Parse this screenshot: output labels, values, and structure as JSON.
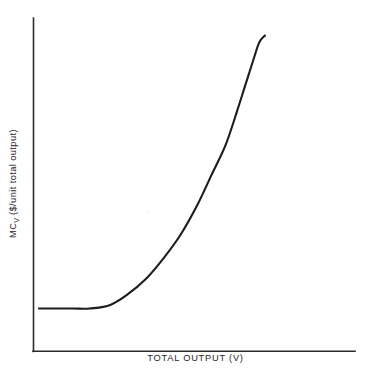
{
  "chart_data": {
    "type": "line",
    "title": "",
    "subtitle": "",
    "xlabel": "TOTAL OUTPUT (V)",
    "ylabel_prefix": "MC",
    "ylabel_subscript": "V",
    "ylabel_suffix": " ($/unit total output)",
    "ylabel_full": "MCV ($/unit total output)",
    "grid": false,
    "legend": null,
    "axis_ticks": [],
    "tick_labels": [],
    "annotations": [],
    "line_color": "#1c1c1c",
    "axis_color": "#2b2b2b",
    "background_color": "#ffffff",
    "xlim": [
      0,
      100
    ],
    "ylim": [
      0,
      100
    ],
    "series": [
      {
        "name": "Marginal cost of total output",
        "description": "Flat at a constant minimum over low output, then rising at an increasing rate (exponential) as output grows.",
        "x": [
          2,
          8,
          14,
          20,
          27,
          33,
          40,
          46,
          52,
          58,
          63,
          68,
          72,
          75,
          78,
          80,
          82
        ],
        "y": [
          13,
          13,
          13,
          13,
          14,
          17,
          22,
          28,
          35,
          44,
          53,
          62,
          72,
          80,
          88,
          93,
          95
        ]
      }
    ]
  },
  "figure": {
    "x_axis_label": "TOTAL OUTPUT (V)",
    "y_axis_label_prefix": "MC",
    "y_axis_label_subscript": "V",
    "y_axis_label_suffix": " ($/unit total output)"
  }
}
